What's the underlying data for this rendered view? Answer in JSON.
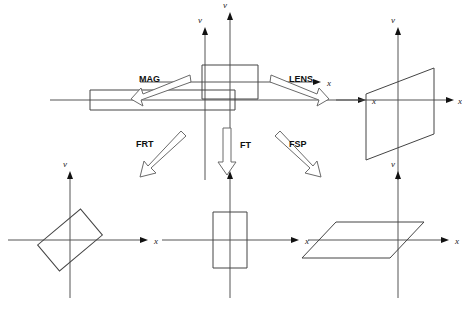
{
  "figure": {
    "width": 462,
    "height": 309,
    "background": "#ffffff",
    "axis_color": "#555555",
    "shape_color": "#444444",
    "arrow_color": "#6a6a6a",
    "label_color": "#101010"
  },
  "axis_labels": {
    "vertical": "v",
    "horizontal": "x"
  },
  "panels": [
    {
      "id": "mag-panel",
      "name": "magnified-rectangle-panel",
      "position": "top-left",
      "origin": [
        205,
        100
      ],
      "axis": {
        "x_from": -155,
        "x_to": 160,
        "y_from": -72,
        "y_to": 80
      },
      "shape": {
        "type": "rectangle",
        "description": "wide flat rectangle, stretched along x",
        "points": "-115,-10 30,-10 30,10 -115,10"
      }
    },
    {
      "id": "input-panel",
      "name": "input-rectangle-panel",
      "position": "top-center",
      "origin": [
        230,
        82
      ],
      "axis": {
        "x_from": -90,
        "x_to": 90,
        "y_from": -68,
        "y_to": 72
      },
      "shape": {
        "type": "rectangle",
        "description": "upright reference rectangle centered on origin",
        "points": "-28,-17 28,-17 28,17 -28,17"
      }
    },
    {
      "id": "lens-panel",
      "name": "lens-sheared-panel",
      "position": "top-right",
      "origin": [
        398,
        100
      ],
      "axis": {
        "x_from": -90,
        "x_to": 55,
        "y_from": -72,
        "y_to": 80
      },
      "shape": {
        "type": "parallelogram",
        "description": "vertical shear: vertical sides, slanted top and bottom",
        "points": "-32,-6 36,-32 36,34 -32,60"
      }
    },
    {
      "id": "frt-panel",
      "name": "fractional-rotated-panel",
      "position": "bottom-left",
      "origin": [
        70,
        240
      ],
      "axis": {
        "x_from": -62,
        "x_to": 78,
        "y_from": -68,
        "y_to": 58
      },
      "shape": {
        "type": "rotated-rectangle",
        "rotation_deg": -40,
        "description": "rectangle rotated counter-clockwise about 40 degrees",
        "points": "-28,-17 28,-17 28,17 -28,17"
      }
    },
    {
      "id": "ft-panel",
      "name": "fourier-rotated-panel",
      "position": "bottom-center",
      "origin": [
        230,
        240
      ],
      "axis": {
        "x_from": -68,
        "x_to": 68,
        "y_from": -68,
        "y_to": 58
      },
      "shape": {
        "type": "rectangle",
        "rotation_deg": 90,
        "description": "rectangle rotated 90 degrees: tall and narrow",
        "points": "-17,-28 17,-28 17,28 -17,28"
      }
    },
    {
      "id": "fsp-panel",
      "name": "free-space-sheared-panel",
      "position": "bottom-right",
      "origin": [
        398,
        240
      ],
      "axis": {
        "x_from": -90,
        "x_to": 50,
        "y_from": -68,
        "y_to": 58
      },
      "shape": {
        "type": "parallelogram",
        "description": "horizontal shear: horizontal top and bottom, slanted sides",
        "points": "-62,-18 26,-18 -8,18 -96,18"
      }
    }
  ],
  "operations": [
    {
      "id": "mag",
      "label": "MAG",
      "name": "mag-operation",
      "direction": "down-left",
      "label_pos": [
        139,
        82
      ],
      "arrow": "M 190,75 L 143,94 L 141,88 L 131,99 L 143,106 L 141,100 L 191,82 Z"
    },
    {
      "id": "lens",
      "label": "LENS",
      "name": "lens-operation",
      "direction": "down-right",
      "label_pos": [
        289,
        82
      ],
      "arrow": "M 271,75 L 317,94 L 319,88 L 329,99 L 317,106 L 319,100 L 270,82 Z"
    },
    {
      "id": "frt",
      "label": "FRT",
      "name": "frt-operation",
      "direction": "down-left",
      "label_pos": [
        136,
        147
      ],
      "arrow": "M 181,131 L 148,166 L 144,161 L 140,176 L 155,173 L 150,169 L 186,136 Z"
    },
    {
      "id": "ft",
      "label": "FT",
      "name": "ft-operation",
      "direction": "down",
      "label_pos": [
        240,
        148
      ],
      "arrow": "M 223,128 L 231,128 L 231,162 L 236,162 L 227,175 L 218,162 L 223,162 Z"
    },
    {
      "id": "fsp",
      "label": "FSP",
      "name": "fsp-operation",
      "direction": "down-right",
      "label_pos": [
        289,
        147
      ],
      "arrow": "M 280,131 L 313,166 L 317,161 L 321,176 L 306,173 L 311,169 L 275,136 Z"
    }
  ]
}
